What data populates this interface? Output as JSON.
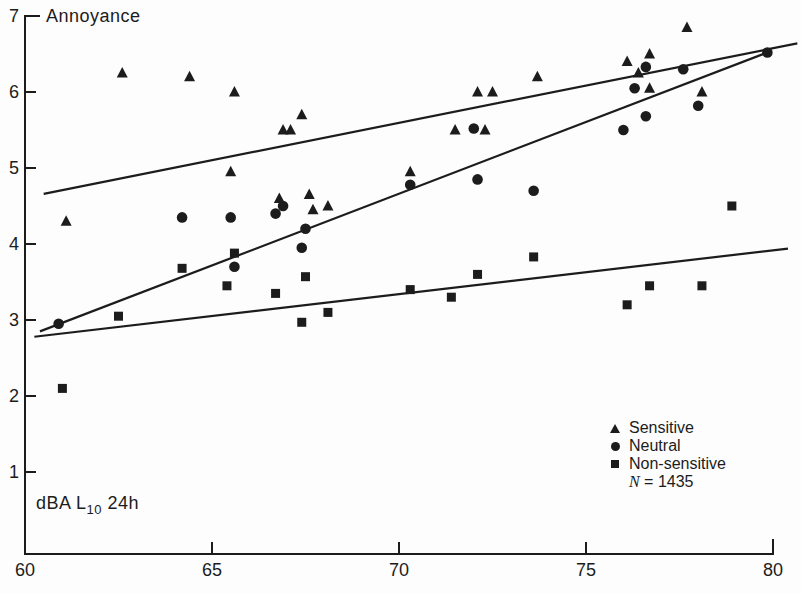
{
  "figure": {
    "background": "#fdfdfd",
    "ink": "#1c1c1c"
  },
  "chart_data": {
    "type": "scatter",
    "title": "Annoyance",
    "ylabel": "Annoyance",
    "xlabel": "dBA L10 24h",
    "xlabel_pre": "dBA L",
    "xlabel_sub": "10",
    "xlabel_post": " 24h",
    "xlim": [
      60,
      80
    ],
    "ylim": [
      0.5,
      7
    ],
    "x_ticks": [
      60,
      65,
      70,
      75,
      80
    ],
    "y_ticks": [
      1,
      2,
      3,
      4,
      5,
      6,
      7
    ],
    "grid": false,
    "legend": {
      "position": "bottom-right",
      "note_n": "N",
      "note_rest": " = 1435",
      "items": [
        {
          "marker": "triangle",
          "label": "Sensitive"
        },
        {
          "marker": "circle",
          "label": "Neutral"
        },
        {
          "marker": "square",
          "label": "Non-sensitive"
        }
      ]
    },
    "series": [
      {
        "name": "Sensitive",
        "marker": "triangle",
        "points": [
          [
            61.1,
            4.3
          ],
          [
            62.6,
            6.25
          ],
          [
            64.4,
            6.2
          ],
          [
            65.5,
            4.95
          ],
          [
            65.6,
            6.0
          ],
          [
            66.8,
            4.6
          ],
          [
            66.9,
            5.5
          ],
          [
            67.1,
            5.5
          ],
          [
            67.4,
            5.7
          ],
          [
            67.6,
            4.65
          ],
          [
            67.7,
            4.45
          ],
          [
            68.1,
            4.5
          ],
          [
            70.3,
            4.95
          ],
          [
            71.5,
            5.5
          ],
          [
            72.1,
            6.0
          ],
          [
            72.3,
            5.5
          ],
          [
            72.5,
            6.0
          ],
          [
            73.7,
            6.2
          ],
          [
            76.1,
            6.4
          ],
          [
            76.4,
            6.25
          ],
          [
            76.7,
            6.5
          ],
          [
            76.7,
            6.05
          ],
          [
            77.7,
            6.85
          ],
          [
            78.1,
            6.0
          ]
        ],
        "trend": {
          "x1": 60.5,
          "y1": 4.66,
          "x2": 80.65,
          "y2": 6.64
        }
      },
      {
        "name": "Neutral",
        "marker": "circle",
        "points": [
          [
            60.9,
            2.95
          ],
          [
            64.2,
            4.35
          ],
          [
            65.5,
            4.35
          ],
          [
            65.6,
            3.7
          ],
          [
            66.7,
            4.4
          ],
          [
            66.9,
            4.5
          ],
          [
            67.4,
            3.95
          ],
          [
            67.5,
            4.2
          ],
          [
            70.3,
            4.78
          ],
          [
            72.0,
            5.52
          ],
          [
            72.1,
            4.85
          ],
          [
            73.6,
            4.7
          ],
          [
            76.0,
            5.5
          ],
          [
            76.3,
            6.05
          ],
          [
            76.6,
            6.33
          ],
          [
            76.6,
            5.68
          ],
          [
            77.6,
            6.3
          ],
          [
            78.0,
            5.82
          ],
          [
            79.85,
            6.52
          ]
        ],
        "trend": {
          "x1": 60.4,
          "y1": 2.85,
          "x2": 79.85,
          "y2": 6.52
        }
      },
      {
        "name": "Non-sensitive",
        "marker": "square",
        "points": [
          [
            61.0,
            2.1
          ],
          [
            62.5,
            3.05
          ],
          [
            64.2,
            3.68
          ],
          [
            65.4,
            3.45
          ],
          [
            65.6,
            3.88
          ],
          [
            66.7,
            3.35
          ],
          [
            67.4,
            2.97
          ],
          [
            67.5,
            3.57
          ],
          [
            68.1,
            3.1
          ],
          [
            70.3,
            3.4
          ],
          [
            71.4,
            3.3
          ],
          [
            72.1,
            3.6
          ],
          [
            73.6,
            3.83
          ],
          [
            76.1,
            3.2
          ],
          [
            76.7,
            3.45
          ],
          [
            78.1,
            3.45
          ],
          [
            78.9,
            4.5
          ]
        ],
        "trend": {
          "x1": 60.25,
          "y1": 2.78,
          "x2": 80.4,
          "y2": 3.94
        }
      }
    ]
  }
}
